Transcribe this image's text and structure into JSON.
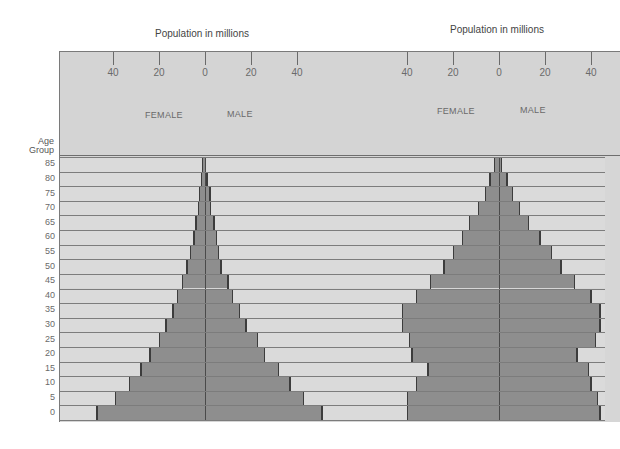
{
  "chart_data": [
    {
      "type": "bar",
      "subtype": "population-pyramid",
      "title": "Population in millions",
      "xlabel": "Population in millions",
      "ylabel": "Age Group",
      "x_ticks": [
        "40",
        "20",
        "0",
        "20",
        "40"
      ],
      "xlim": [
        -50,
        50
      ],
      "legend": [
        "FEMALE",
        "MALE"
      ],
      "categories": [
        "0",
        "5",
        "10",
        "15",
        "20",
        "25",
        "30",
        "35",
        "40",
        "45",
        "50",
        "55",
        "60",
        "65",
        "70",
        "75",
        "80",
        "85"
      ],
      "series": [
        {
          "name": "FEMALE",
          "values": [
            47,
            39,
            33,
            28,
            24,
            20,
            17,
            14,
            12,
            10,
            8,
            6.5,
            5,
            4,
            3,
            2.6,
            1.7,
            1.3
          ]
        },
        {
          "name": "MALE",
          "values": [
            51,
            43,
            37,
            32,
            26,
            23,
            18,
            15,
            12,
            10,
            7,
            6,
            5,
            4,
            2.6,
            2.2,
            0.9,
            0.4
          ]
        }
      ],
      "grid": true
    },
    {
      "type": "bar",
      "subtype": "population-pyramid",
      "title": "Population in millions",
      "xlabel": "Population in millions",
      "ylabel": "Age Group",
      "x_ticks": [
        "40",
        "20",
        "0",
        "20",
        "40"
      ],
      "xlim": [
        -50,
        50
      ],
      "legend": [
        "FEMALE",
        "MALE"
      ],
      "categories": [
        "0",
        "5",
        "10",
        "15",
        "20",
        "25",
        "30",
        "35",
        "40",
        "45",
        "50",
        "55",
        "60",
        "65",
        "70",
        "75",
        "80",
        "85"
      ],
      "series": [
        {
          "name": "FEMALE",
          "values": [
            40,
            40,
            36,
            31,
            38,
            39,
            42,
            42,
            36,
            30,
            24,
            20,
            16,
            13,
            9,
            6,
            4,
            2
          ]
        },
        {
          "name": "MALE",
          "values": [
            44,
            43,
            40,
            39,
            34,
            42,
            44,
            44,
            40,
            33,
            27,
            23,
            18,
            13,
            9,
            6,
            3.5,
            1.3
          ]
        }
      ],
      "grid": true
    }
  ],
  "labels": {
    "left_title": "Population in millions",
    "right_title": "Population in millions",
    "age_group_line1": "Age",
    "age_group_line2": "Group",
    "female": "FEMALE",
    "male": "MALE",
    "ticks": [
      "40",
      "20",
      "0",
      "20",
      "40"
    ],
    "ages": [
      "85",
      "80",
      "75",
      "70",
      "65",
      "60",
      "55",
      "50",
      "45",
      "40",
      "35",
      "30",
      "25",
      "20",
      "15",
      "10",
      "5",
      "0"
    ]
  },
  "colors": {
    "background": "#ffffff",
    "panel": "#d6d6d6",
    "bar_fill": "#8e8e8e",
    "bar_edge": "#3c3c3c",
    "grid": "#7c7c7c"
  }
}
